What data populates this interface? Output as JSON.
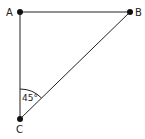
{
  "diagram": {
    "type": "right-triangle",
    "points": [
      {
        "label": "A",
        "x": 20,
        "y": 12
      },
      {
        "label": "B",
        "x": 130,
        "y": 12
      },
      {
        "label": "C",
        "x": 20,
        "y": 119
      }
    ],
    "segments": [
      [
        "A",
        "B"
      ],
      [
        "A",
        "C"
      ],
      [
        "C",
        "B"
      ]
    ],
    "angle": {
      "vertex": "C",
      "label": "45°"
    },
    "colors": {
      "line": "#222222",
      "point": "#111111"
    }
  }
}
